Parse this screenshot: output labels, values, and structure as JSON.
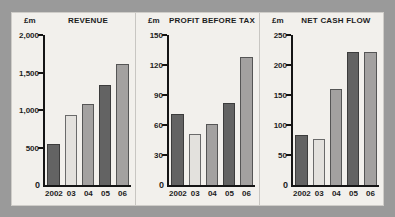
{
  "figure": {
    "background_color": "#9a9a9a",
    "panel_color": "#f2f0ec"
  },
  "palette": {
    "dark": "#636363",
    "light": "#e3e1dd",
    "medium": "#a3a1a0",
    "axis": "#151515",
    "text": "#1d1d1d"
  },
  "charts": [
    {
      "unit": "£m",
      "title": "REVENUE",
      "zero_label": "0",
      "yticks": [
        "500",
        "1,000",
        "1,500",
        "2,000"
      ],
      "xlabels": [
        "2002",
        "03",
        "04",
        "05",
        "06"
      ]
    },
    {
      "unit": "£m",
      "title": "PROFIT BEFORE TAX",
      "zero_label": "0",
      "yticks": [
        "30",
        "60",
        "90",
        "120",
        "150"
      ],
      "xlabels": [
        "2002",
        "03",
        "04",
        "05",
        "06"
      ]
    },
    {
      "unit": "£m",
      "title": "NET CASH FLOW",
      "zero_label": "0",
      "yticks": [
        "50",
        "100",
        "150",
        "200",
        "250"
      ],
      "xlabels": [
        "2002",
        "03",
        "04",
        "05",
        "06"
      ]
    }
  ],
  "chart_data": [
    {
      "type": "bar",
      "title": "REVENUE",
      "xlabel": "",
      "ylabel": "£m",
      "categories": [
        "2002",
        "03",
        "04",
        "05",
        "06"
      ],
      "values": [
        550,
        935,
        1085,
        1340,
        1620
      ],
      "ylim": [
        0,
        2000
      ],
      "yticks": [
        0,
        500,
        1000,
        1500,
        2000
      ],
      "grid": false,
      "legend": "none",
      "bar_colors": [
        "#636363",
        "#e3e1dd",
        "#a3a1a0",
        "#636363",
        "#a3a1a0"
      ]
    },
    {
      "type": "bar",
      "title": "PROFIT BEFORE TAX",
      "xlabel": "",
      "ylabel": "£m",
      "categories": [
        "2002",
        "03",
        "04",
        "05",
        "06"
      ],
      "values": [
        71,
        51,
        61,
        82,
        128
      ],
      "ylim": [
        0,
        150
      ],
      "yticks": [
        0,
        30,
        60,
        90,
        120,
        150
      ],
      "grid": false,
      "legend": "none",
      "bar_colors": [
        "#636363",
        "#e3e1dd",
        "#a3a1a0",
        "#636363",
        "#a3a1a0"
      ]
    },
    {
      "type": "bar",
      "title": "NET CASH FLOW",
      "xlabel": "",
      "ylabel": "£m",
      "categories": [
        "2002",
        "03",
        "04",
        "05",
        "06"
      ],
      "values": [
        84,
        77,
        160,
        221,
        222
      ],
      "ylim": [
        0,
        250
      ],
      "yticks": [
        0,
        50,
        100,
        150,
        200,
        250
      ],
      "grid": false,
      "legend": "none",
      "bar_colors": [
        "#636363",
        "#e3e1dd",
        "#a3a1a0",
        "#636363",
        "#a3a1a0"
      ]
    }
  ]
}
